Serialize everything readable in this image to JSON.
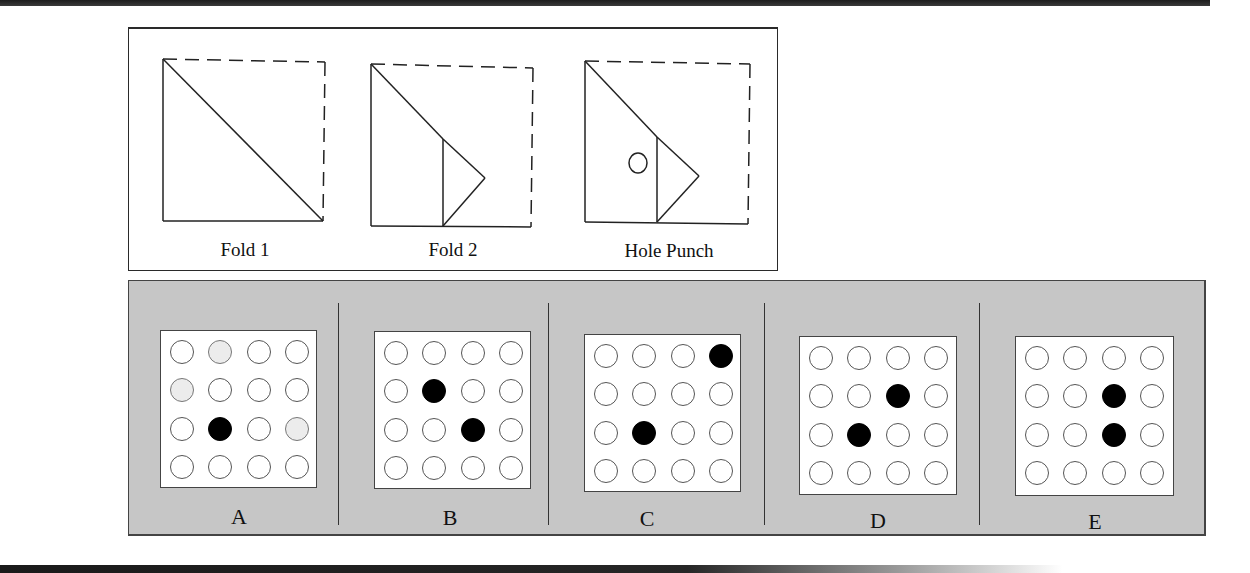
{
  "puzzle": {
    "steps": [
      {
        "label": "Fold 1"
      },
      {
        "label": "Fold 2"
      },
      {
        "label": "Hole Punch"
      }
    ],
    "options": [
      {
        "label": "A",
        "grid": [
          [
            "empty",
            "faint",
            "empty",
            "empty"
          ],
          [
            "faint",
            "empty",
            "empty",
            "empty"
          ],
          [
            "empty",
            "punched",
            "empty",
            "faint"
          ],
          [
            "empty",
            "empty",
            "empty",
            "empty"
          ]
        ]
      },
      {
        "label": "B",
        "grid": [
          [
            "empty",
            "empty",
            "empty",
            "empty"
          ],
          [
            "empty",
            "punched",
            "empty",
            "empty"
          ],
          [
            "empty",
            "empty",
            "punched",
            "empty"
          ],
          [
            "empty",
            "empty",
            "empty",
            "empty"
          ]
        ]
      },
      {
        "label": "C",
        "grid": [
          [
            "empty",
            "empty",
            "empty",
            "punched"
          ],
          [
            "empty",
            "empty",
            "empty",
            "empty"
          ],
          [
            "empty",
            "punched",
            "empty",
            "empty"
          ],
          [
            "empty",
            "empty",
            "empty",
            "empty"
          ]
        ]
      },
      {
        "label": "D",
        "grid": [
          [
            "empty",
            "empty",
            "empty",
            "empty"
          ],
          [
            "empty",
            "empty",
            "punched",
            "empty"
          ],
          [
            "empty",
            "punched",
            "empty",
            "empty"
          ],
          [
            "empty",
            "empty",
            "empty",
            "empty"
          ]
        ]
      },
      {
        "label": "E",
        "grid": [
          [
            "empty",
            "empty",
            "empty",
            "empty"
          ],
          [
            "empty",
            "empty",
            "punched",
            "empty"
          ],
          [
            "empty",
            "empty",
            "punched",
            "empty"
          ],
          [
            "empty",
            "empty",
            "empty",
            "empty"
          ]
        ]
      }
    ]
  },
  "colors": {
    "panel_gray": "#c6c6c6",
    "hole_punched": "#000000",
    "hole_faint": "#ececec"
  }
}
